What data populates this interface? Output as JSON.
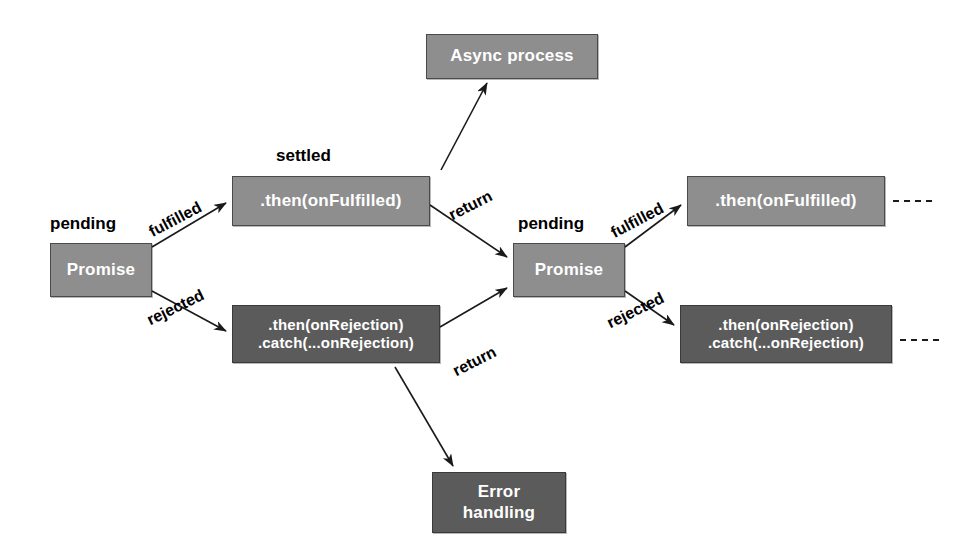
{
  "diagram": {
    "colors": {
      "mid_gray": "#8e8e8e",
      "dark_gray": "#5b5b5b",
      "box_text": "#ffffff",
      "label_text": "#000000",
      "edge_stroke": "#1a1a1a",
      "background": "#ffffff"
    },
    "nodes": [
      {
        "id": "async_process",
        "label_lines": [
          "Async process"
        ],
        "tone": "mid",
        "x": 426,
        "y": 34,
        "w": 172,
        "h": 45,
        "font_size": 17
      },
      {
        "id": "promise_1",
        "label_lines": [
          "Promise"
        ],
        "tone": "mid",
        "x": 50,
        "y": 243,
        "w": 102,
        "h": 54,
        "font_size": 17
      },
      {
        "id": "then_fulfilled_1",
        "label_lines": [
          ".then(onFulfilled)"
        ],
        "tone": "mid",
        "x": 232,
        "y": 176,
        "w": 198,
        "h": 50,
        "font_size": 17
      },
      {
        "id": "then_rejected_1",
        "label_lines": [
          ".then(onRejection)",
          ".catch(...onRejection)"
        ],
        "tone": "dark",
        "x": 232,
        "y": 305,
        "w": 208,
        "h": 58,
        "font_size": 15
      },
      {
        "id": "promise_2",
        "label_lines": [
          "Promise"
        ],
        "tone": "mid",
        "x": 513,
        "y": 243,
        "w": 112,
        "h": 54,
        "font_size": 17
      },
      {
        "id": "then_fulfilled_2",
        "label_lines": [
          ".then(onFulfilled)"
        ],
        "tone": "mid",
        "x": 687,
        "y": 176,
        "w": 198,
        "h": 50,
        "font_size": 17
      },
      {
        "id": "then_rejected_2",
        "label_lines": [
          ".then(onRejection)",
          ".catch(...onRejection)"
        ],
        "tone": "dark",
        "x": 680,
        "y": 305,
        "w": 212,
        "h": 58,
        "font_size": 15
      },
      {
        "id": "error_handling",
        "label_lines": [
          "Error",
          "handling"
        ],
        "tone": "dark",
        "x": 432,
        "y": 472,
        "w": 134,
        "h": 61,
        "font_size": 17
      }
    ],
    "state_labels": [
      {
        "id": "pending_1",
        "text": "pending",
        "x": 50,
        "y": 214,
        "font_size": 17
      },
      {
        "id": "settled",
        "text": "settled",
        "x": 276,
        "y": 146,
        "font_size": 17
      },
      {
        "id": "pending_2",
        "text": "pending",
        "x": 518,
        "y": 214,
        "font_size": 17
      }
    ],
    "edge_labels": [
      {
        "id": "fulfilled_1",
        "text": "fulfilled",
        "x": 146,
        "y": 225,
        "rotate": -28,
        "font_size": 16
      },
      {
        "id": "rejected_1",
        "text": "rejected",
        "x": 144,
        "y": 313,
        "rotate": -26,
        "font_size": 16
      },
      {
        "id": "return_1",
        "text": "return",
        "x": 446,
        "y": 208,
        "rotate": -27,
        "font_size": 16
      },
      {
        "id": "return_2",
        "text": "return",
        "x": 450,
        "y": 364,
        "rotate": -27,
        "font_size": 16
      },
      {
        "id": "fulfilled_2",
        "text": "fulfilled",
        "x": 608,
        "y": 226,
        "rotate": -28,
        "font_size": 16
      },
      {
        "id": "rejected_2",
        "text": "rejected",
        "x": 604,
        "y": 316,
        "rotate": -26,
        "font_size": 16
      }
    ],
    "edges": [
      {
        "id": "promise1-to-then-fulfilled",
        "from": "promise_1",
        "to": "then_fulfilled_1",
        "kind": "arrow",
        "points": "152,247 226,203"
      },
      {
        "id": "promise1-to-then-rejected",
        "from": "promise_1",
        "to": "then_rejected_1",
        "kind": "arrow",
        "points": "152,291 226,331"
      },
      {
        "id": "then-fulfilled-to-async",
        "from": "then_fulfilled_1",
        "to": "async_process",
        "kind": "arrow",
        "points": "441,170 487,83"
      },
      {
        "id": "then-fulfilled-to-promise2",
        "from": "then_fulfilled_1",
        "to": "promise_2",
        "kind": "arrow",
        "points": "430,205 507,257"
      },
      {
        "id": "then-rejected-to-promise2",
        "from": "then_rejected_1",
        "to": "promise_2",
        "kind": "arrow",
        "points": "440,327 507,288"
      },
      {
        "id": "then-rejected-to-error",
        "from": "then_rejected_1",
        "to": "error_handling",
        "kind": "arrow",
        "points": "395,367 453,466"
      },
      {
        "id": "promise2-to-then-fulfilled",
        "from": "promise_2",
        "to": "then_fulfilled_2",
        "kind": "arrow",
        "points": "625,247 681,205"
      },
      {
        "id": "promise2-to-then-rejected",
        "from": "promise_2",
        "to": "then_rejected_2",
        "kind": "arrow",
        "points": "625,291 674,325"
      },
      {
        "id": "continuation-fulfilled",
        "from": "then_fulfilled_2",
        "to": null,
        "kind": "dashed",
        "points": "893,201 937,201"
      },
      {
        "id": "continuation-rejected",
        "from": "then_rejected_2",
        "to": null,
        "kind": "dashed",
        "points": "900,340 944,340"
      }
    ]
  }
}
